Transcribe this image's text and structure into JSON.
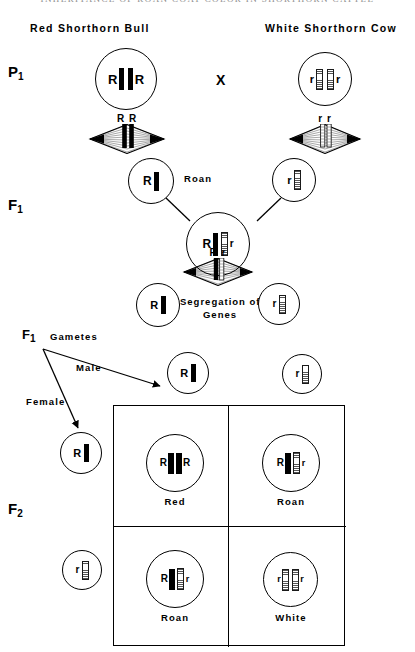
{
  "page": {
    "running_header": "INHERITANCE OF ROAN COAT COLOR IN SHORTHORN CATTLE",
    "width": 415,
    "height": 652,
    "ink_color": "#000000",
    "dominant_chromosome_color": "#000000",
    "recessive_chromosome_color": "#ffffff"
  },
  "parents": {
    "male_label": "Red Shorthorn Bull",
    "female_label": "White Shorthorn Cow",
    "cross_symbol": "X",
    "male_cell": {
      "left_allele": "R",
      "right_allele": "R",
      "chromosomes": [
        "dominant",
        "dominant"
      ]
    },
    "female_cell": {
      "left_allele": "r",
      "right_allele": "r",
      "chromosomes": [
        "recessive",
        "recessive"
      ]
    },
    "male_spindle_label": "R R",
    "female_spindle_label": "r r"
  },
  "generations": {
    "p1": "P",
    "p1_sub": "1",
    "f1": "F",
    "f1_sub": "1",
    "f2": "F",
    "f2_sub": "2"
  },
  "f1": {
    "male_gamete": {
      "allele": "R",
      "chromosome": "dominant"
    },
    "female_gamete": {
      "allele": "r",
      "chromosome": "recessive"
    },
    "zygote_label": "Roan",
    "zygote": {
      "left_allele": "R",
      "right_allele": "r",
      "chromosomes": [
        "dominant",
        "recessive"
      ]
    },
    "zygote_genotype": "Rr",
    "segregation_label_line1": "Segregation of",
    "segregation_label_line2": "Genes",
    "segregation_spindle_label": "R r",
    "segregated_left": {
      "allele": "R",
      "chromosome": "dominant"
    },
    "segregated_right": {
      "allele": "r",
      "chromosome": "recessive"
    }
  },
  "gametes": {
    "title": "Gametes",
    "male_label": "Male",
    "female_label": "Female",
    "male_row": [
      {
        "allele": "R",
        "chromosome": "dominant"
      },
      {
        "allele": "r",
        "chromosome": "recessive"
      }
    ],
    "female_column": [
      {
        "allele": "R",
        "chromosome": "dominant"
      },
      {
        "allele": "r",
        "chromosome": "recessive"
      }
    ]
  },
  "punnett": {
    "cells": [
      {
        "row": 0,
        "col": 0,
        "left_allele": "R",
        "right_allele": "R",
        "chromosomes": [
          "dominant",
          "dominant"
        ],
        "phenotype": "Red"
      },
      {
        "row": 0,
        "col": 1,
        "left_allele": "R",
        "right_allele": "r",
        "chromosomes": [
          "dominant",
          "recessive"
        ],
        "phenotype": "Roan"
      },
      {
        "row": 1,
        "col": 0,
        "left_allele": "R",
        "right_allele": "r",
        "chromosomes": [
          "dominant",
          "recessive"
        ],
        "phenotype": "Roan"
      },
      {
        "row": 1,
        "col": 1,
        "left_allele": "r",
        "right_allele": "r",
        "chromosomes": [
          "recessive",
          "recessive"
        ],
        "phenotype": "White"
      }
    ]
  }
}
